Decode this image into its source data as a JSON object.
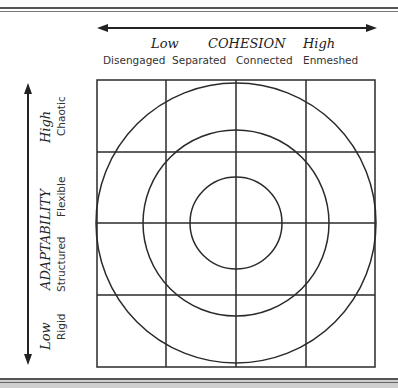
{
  "cohesion": {
    "title": "COHESION",
    "low": "Low",
    "high": "High",
    "levels": [
      "Disengaged",
      "Separated",
      "Connected",
      "Enmeshed"
    ]
  },
  "adaptability": {
    "title": "ADAPTABILITY",
    "low": "Low",
    "high": "High",
    "levels": [
      "Rigid",
      "Structured",
      "Flexible",
      "Chaotic"
    ]
  },
  "grid": {
    "rows": 4,
    "cols": 4,
    "circles": 3
  },
  "colors": {
    "line": "#2a2a2a",
    "background": "#ffffff",
    "footer": "#cfcfcf"
  }
}
